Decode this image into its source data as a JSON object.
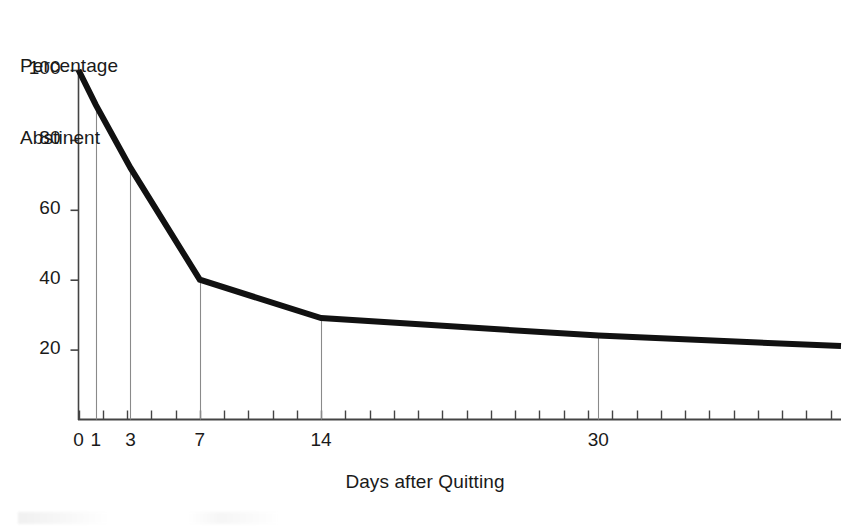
{
  "chart_data": {
    "type": "line",
    "title": "",
    "ylabel": "Percentage\nAbstinent",
    "ylabel_line1": "Percentage",
    "ylabel_line2": "Abstinent",
    "xlabel": "Days after Quitting",
    "x": [
      0,
      1,
      3,
      7,
      14,
      30,
      44
    ],
    "values": [
      100,
      90,
      72,
      40,
      29,
      24,
      21
    ],
    "series": [
      {
        "name": "Percentage Abstinent",
        "values": [
          100,
          90,
          72,
          40,
          29,
          24,
          21
        ],
        "color": "#111111"
      }
    ],
    "xlim": [
      0,
      44
    ],
    "ylim": [
      0,
      100
    ],
    "ytick_values": [
      20,
      40,
      60,
      80,
      100
    ],
    "ytick_labels": [
      "20",
      "40",
      "60",
      "80",
      "100"
    ],
    "xtick_labeled_values": [
      0,
      1,
      3,
      7,
      14,
      30
    ],
    "xtick_labels": [
      "0",
      "1",
      "3",
      "7",
      "14",
      "30"
    ],
    "xtick_minor_step": 1.4,
    "grid": false,
    "legend": false,
    "dropline_x": [
      1,
      3,
      7,
      14,
      30
    ],
    "line_width_px": 6,
    "axis_color": "#444444",
    "line_color": "#111111",
    "background": "#ffffff"
  },
  "axes": {
    "y_title_line1": "Percentage",
    "y_title_line2": "Abstinent",
    "x_title": "Days after Quitting"
  },
  "y_ticks": [
    {
      "label": "100",
      "value": 100
    },
    {
      "label": "80",
      "value": 80
    },
    {
      "label": "60",
      "value": 60
    },
    {
      "label": "40",
      "value": 40
    },
    {
      "label": "20",
      "value": 20
    }
  ],
  "x_ticks": [
    {
      "label": "0",
      "value": 0
    },
    {
      "label": "1",
      "value": 1
    },
    {
      "label": "3",
      "value": 3
    },
    {
      "label": "7",
      "value": 7
    },
    {
      "label": "14",
      "value": 14
    },
    {
      "label": "30",
      "value": 30
    }
  ]
}
